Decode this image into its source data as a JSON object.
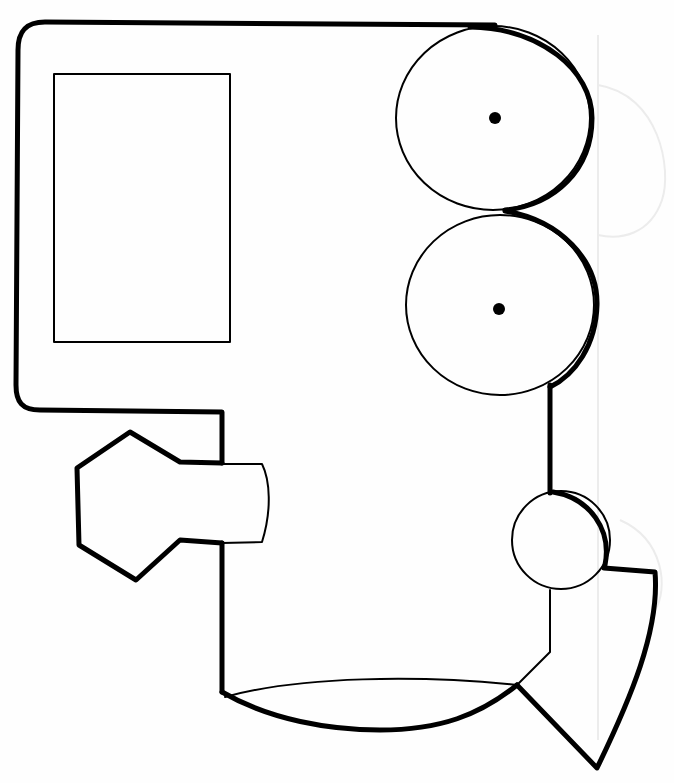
{
  "drawing": {
    "subject": "train-engine-outline",
    "style": "coloring-page line art",
    "colors": {
      "background": "#fefefe",
      "line": "#000000",
      "bleed_through": "#ececec"
    },
    "parts": [
      {
        "name": "cab",
        "shape": "rounded-rectangle"
      },
      {
        "name": "cab-window",
        "shape": "rectangle"
      },
      {
        "name": "upper-wheel",
        "shape": "circle",
        "has_center_dot": true
      },
      {
        "name": "lower-wheel",
        "shape": "circle",
        "has_center_dot": true
      },
      {
        "name": "small-wheel",
        "shape": "circle",
        "has_center_dot": false
      },
      {
        "name": "smokestack",
        "shape": "hexagon-with-neck"
      },
      {
        "name": "boiler-base",
        "shape": "lens"
      },
      {
        "name": "cowcatcher",
        "shape": "wedge"
      }
    ]
  }
}
